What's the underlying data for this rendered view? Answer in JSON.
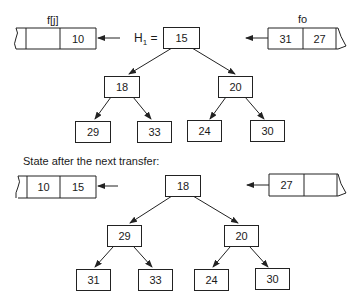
{
  "top": {
    "left_array": {
      "label": "f[j]",
      "cells": [
        "",
        "10"
      ]
    },
    "right_array": {
      "label": "fo",
      "cells": [
        "31",
        "27"
      ]
    },
    "heap_label": "H",
    "heap_subscript": "1",
    "heap_equals": "=",
    "tree": {
      "root": "15",
      "left": "18",
      "right": "20",
      "left_left": "29",
      "left_right": "33",
      "right_left": "24",
      "right_right": "30"
    }
  },
  "caption": "State after the next transfer:",
  "bottom": {
    "left_array": {
      "cells": [
        "10",
        "15"
      ]
    },
    "right_array": {
      "cells": [
        "27",
        ""
      ]
    },
    "tree": {
      "root": "18",
      "left": "29",
      "right": "20",
      "left_left": "31",
      "left_right": "33",
      "right_left": "24",
      "right_right": "30"
    }
  }
}
